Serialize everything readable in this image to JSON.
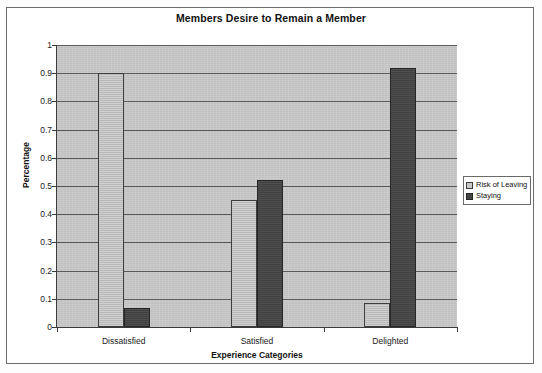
{
  "chart_data": {
    "type": "bar",
    "title": "Members Desire to Remain a Member",
    "xlabel": "Experience Categories",
    "ylabel": "Percentage",
    "categories": [
      "Dissatisfied",
      "Satisfied",
      "Delighted"
    ],
    "series": [
      {
        "name": "Risk of Leaving",
        "values": [
          0.9,
          0.45,
          0.085
        ],
        "color": "#c0c0c0"
      },
      {
        "name": "Staying",
        "values": [
          0.068,
          0.52,
          0.92
        ],
        "color": "#454545"
      }
    ],
    "ylim": [
      0,
      1
    ],
    "yticks": [
      "0",
      "0.1",
      "0.2",
      "0.3",
      "0.4",
      "0.5",
      "0.6",
      "0.7",
      "0.8",
      "0.9",
      "1"
    ],
    "ytick_values": [
      0,
      0.1,
      0.2,
      0.3,
      0.4,
      0.5,
      0.6,
      0.7,
      0.8,
      0.9,
      1
    ],
    "grid": "horizontal",
    "legend_position": "right",
    "plot_background": "#c9c9c9"
  }
}
